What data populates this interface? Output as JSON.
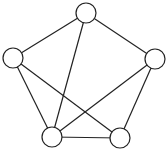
{
  "diagram": {
    "type": "undirected-graph",
    "node_radius": 10,
    "colors": {
      "stroke": "#222222",
      "fill": "#ffffff",
      "background": "#ffffff"
    },
    "nodes": [
      {
        "id": "top",
        "x": 86,
        "y": 13
      },
      {
        "id": "left",
        "x": 13,
        "y": 58
      },
      {
        "id": "right",
        "x": 155,
        "y": 59
      },
      {
        "id": "bottom-left",
        "x": 52,
        "y": 137
      },
      {
        "id": "bottom-right",
        "x": 120,
        "y": 138
      }
    ],
    "edges": [
      {
        "from": "top",
        "to": "left"
      },
      {
        "from": "top",
        "to": "right"
      },
      {
        "from": "top",
        "to": "bottom-left"
      },
      {
        "from": "left",
        "to": "bottom-left"
      },
      {
        "from": "left",
        "to": "bottom-right"
      },
      {
        "from": "right",
        "to": "bottom-left"
      },
      {
        "from": "right",
        "to": "bottom-right"
      },
      {
        "from": "bottom-left",
        "to": "bottom-right"
      }
    ]
  }
}
